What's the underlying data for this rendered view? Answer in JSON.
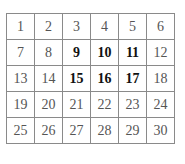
{
  "grid": {
    "rows": 5,
    "cols": 6,
    "cells": [
      {
        "value": "1",
        "bold": false
      },
      {
        "value": "2",
        "bold": false
      },
      {
        "value": "3",
        "bold": false
      },
      {
        "value": "4",
        "bold": false
      },
      {
        "value": "5",
        "bold": false
      },
      {
        "value": "6",
        "bold": false
      },
      {
        "value": "7",
        "bold": false
      },
      {
        "value": "8",
        "bold": false
      },
      {
        "value": "9",
        "bold": true
      },
      {
        "value": "10",
        "bold": true
      },
      {
        "value": "11",
        "bold": true
      },
      {
        "value": "12",
        "bold": false
      },
      {
        "value": "13",
        "bold": false
      },
      {
        "value": "14",
        "bold": false
      },
      {
        "value": "15",
        "bold": true
      },
      {
        "value": "16",
        "bold": true
      },
      {
        "value": "17",
        "bold": true
      },
      {
        "value": "18",
        "bold": false
      },
      {
        "value": "19",
        "bold": false
      },
      {
        "value": "20",
        "bold": false
      },
      {
        "value": "21",
        "bold": false
      },
      {
        "value": "22",
        "bold": false
      },
      {
        "value": "23",
        "bold": false
      },
      {
        "value": "24",
        "bold": false
      },
      {
        "value": "25",
        "bold": false
      },
      {
        "value": "26",
        "bold": false
      },
      {
        "value": "27",
        "bold": false
      },
      {
        "value": "28",
        "bold": false
      },
      {
        "value": "29",
        "bold": false
      },
      {
        "value": "30",
        "bold": false
      }
    ]
  },
  "colors": {
    "border": "#8a8a8a",
    "text": "#555555",
    "bold_text": "#111111"
  }
}
